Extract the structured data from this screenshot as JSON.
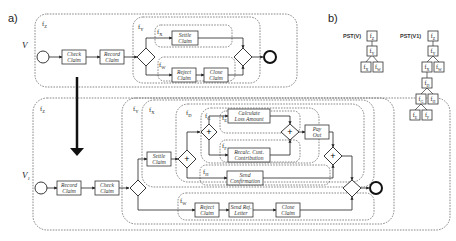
{
  "panels": {
    "a": "a)",
    "b": "b)"
  },
  "models": {
    "v": "V",
    "v1": "V",
    "v1_sub": "1"
  },
  "regions": {
    "v": {
      "z": "Z",
      "y": "Y",
      "x": "X",
      "w": "W"
    },
    "v1": {
      "z": "Z",
      "y": "Y",
      "x": "X",
      "d": "D",
      "g": "G",
      "e": "E",
      "f": "F",
      "h": "H",
      "w": "W"
    }
  },
  "tasks_v": {
    "check_claim": [
      "Check",
      "Claim"
    ],
    "record_claim": [
      "Record",
      "Claim"
    ],
    "settle_claim": [
      "Settle",
      "Claim"
    ],
    "reject_claim": [
      "Reject",
      "Claim"
    ],
    "close_claim": [
      "Close",
      "Claim"
    ]
  },
  "tasks_v1": {
    "record_claim": [
      "Record",
      "Claim"
    ],
    "check_claim": [
      "Check",
      "Claim"
    ],
    "settle_claim": [
      "Settle",
      "Claim"
    ],
    "calculate_loss": [
      "Calculate",
      "Loss Amount"
    ],
    "recalc_cust": [
      "Recalc. Cust.",
      "Contribution"
    ],
    "send_confirmation": [
      "Send",
      "Confirmation"
    ],
    "pay_out": [
      "Pay",
      "Out"
    ],
    "reject_claim": [
      "Reject",
      "Claim"
    ],
    "send_rej_letter": [
      "Send Rej.",
      "Letter"
    ],
    "close_claim": [
      "Close",
      "Claim"
    ]
  },
  "gateways": {
    "and": "+"
  },
  "pst": {
    "v_title": "PST(V)",
    "v1_title": "PST(V1)",
    "v_nodes": [
      "Z",
      "Y",
      "X",
      "W"
    ],
    "v1_nodes": [
      "Z",
      "Y",
      "X",
      "W",
      "D",
      "G",
      "H",
      "E",
      "F"
    ]
  }
}
